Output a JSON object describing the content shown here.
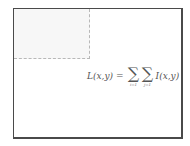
{
  "diagram": {
    "frame": {
      "border_color": "#4a4a4a"
    },
    "region": {
      "fill": "#f7f7f7",
      "border_style": "dashed",
      "border_color": "#b8b8b8"
    },
    "formula": {
      "lhs": "L(x,y)",
      "equals": "=",
      "sum1_symbol": "∑",
      "sum1_index": "i=1",
      "sum2_symbol": "∑",
      "sum2_index": "j=1",
      "rhs": "I(x,y)"
    }
  }
}
